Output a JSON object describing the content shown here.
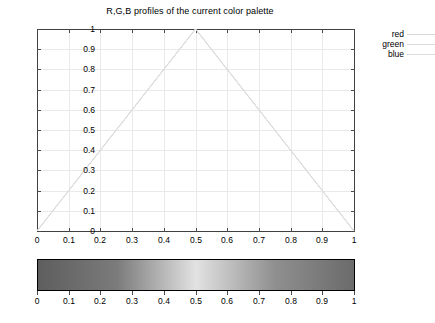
{
  "chart_data": {
    "type": "line",
    "title": "R,G,B profiles of the current color palette",
    "xlabel": "",
    "ylabel": "",
    "xlim": [
      0,
      1
    ],
    "ylim": [
      0,
      1
    ],
    "grid": true,
    "legend_position": "top-right-outside",
    "x": [
      0,
      0.1,
      0.2,
      0.3,
      0.4,
      0.5,
      0.6,
      0.7,
      0.8,
      0.9,
      1
    ],
    "xticks": [
      "0",
      "0.1",
      "0.2",
      "0.3",
      "0.4",
      "0.5",
      "0.6",
      "0.7",
      "0.8",
      "0.9",
      "1"
    ],
    "yticks": [
      "0",
      "0.1",
      "0.2",
      "0.3",
      "0.4",
      "0.5",
      "0.6",
      "0.7",
      "0.8",
      "0.9",
      "1"
    ],
    "series": [
      {
        "name": "red",
        "color": "#d9d9d9",
        "values": [
          0,
          0.2,
          0.4,
          0.6,
          0.8,
          1,
          0.8,
          0.6,
          0.4,
          0.2,
          0
        ]
      },
      {
        "name": "green",
        "color": "#dcdcdc",
        "values": [
          0,
          0.2,
          0.4,
          0.6,
          0.8,
          1,
          0.8,
          0.6,
          0.4,
          0.2,
          0
        ]
      },
      {
        "name": "blue",
        "color": "#dcdcdc",
        "values": [
          0,
          0.2,
          0.4,
          0.6,
          0.8,
          1,
          0.8,
          0.6,
          0.4,
          0.2,
          0
        ]
      }
    ],
    "annotations": {
      "peak_x": 0.5,
      "peak_y": 1
    }
  },
  "palette": {
    "name": "current-color-palette",
    "axis_ticks": [
      "0",
      "0.1",
      "0.2",
      "0.3",
      "0.4",
      "0.5",
      "0.6",
      "0.7",
      "0.8",
      "0.9",
      "1"
    ],
    "gradient_stops": [
      {
        "pos": 0,
        "color": "#5e5e5e"
      },
      {
        "pos": 0.25,
        "color": "#7b7b7b"
      },
      {
        "pos": 0.5,
        "color": "#e2e2e2"
      },
      {
        "pos": 0.75,
        "color": "#8f8f8f"
      },
      {
        "pos": 1,
        "color": "#6b6b6b"
      }
    ],
    "border_color": "#000000"
  },
  "colors": {
    "grid": "#e9e9e9",
    "axis": "#404040",
    "text": "#000000",
    "background": "#ffffff"
  }
}
